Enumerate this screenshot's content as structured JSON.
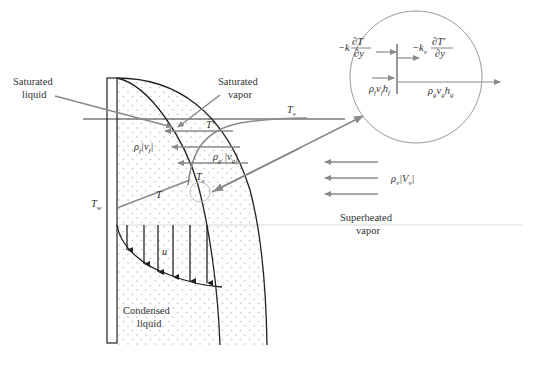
{
  "figure": {
    "colors": {
      "ink": "#222222",
      "gray_arrow": "#8a8a8a",
      "circle": "#9a9a9a",
      "dots": "#bdbdbd",
      "divider": "#c8c8c8"
    }
  },
  "labels": {
    "saturated_liquid_1": "Saturated",
    "saturated_liquid_2": "liquid",
    "saturated_vapor_1": "Saturated",
    "saturated_vapor_2": "vapor",
    "superheated_vapor_1": "Superheated",
    "superheated_vapor_2": "vapor",
    "condensed_liquid_1": "Condensed",
    "condensed_liquid_2": "liquid"
  },
  "symbols": {
    "T_v": "T",
    "T_v_sub": "v",
    "T_w": "T",
    "T_w_sub": "w",
    "T_s": "T",
    "T_s_sub": "s",
    "T_prime": "T′",
    "T_liquid": "T",
    "u": "u",
    "rho_f_vf": "ρ",
    "rho_f_vf_sub": "f",
    "rho_f_vf_rest": "|v",
    "rho_f_vf_rest_sub": "f",
    "rho_f_vf_end": "|",
    "rho_g_vg": "ρ",
    "rho_g_vg_sub": "g",
    "rho_g_vg_rest": " |v",
    "rho_g_vg_rest_sub": "g",
    "rho_g_vg_end": "|",
    "rho_v_Vv": "ρ",
    "rho_v_Vv_sub": "v",
    "rho_v_Vv_rest": "|V",
    "rho_v_Vv_rest_sub": "v",
    "rho_v_Vv_end": "|"
  },
  "inset": {
    "conduction_liquid_prefix": "−k",
    "conduction_liquid_num": "∂T",
    "conduction_liquid_den": "∂y",
    "conduction_vapor_prefix": "−k",
    "conduction_vapor_prefix_sub": "v",
    "conduction_vapor_num": "∂T′",
    "conduction_vapor_den": "∂y",
    "enthalpy_liquid": "ρ",
    "enthalpy_liquid_sub1": "f",
    "enthalpy_liquid_mid": "v",
    "enthalpy_liquid_sub2": "f",
    "enthalpy_liquid_h": "h",
    "enthalpy_liquid_sub3": "f",
    "enthalpy_vapor": "ρ",
    "enthalpy_vapor_sub1": "g",
    "enthalpy_vapor_mid": "v",
    "enthalpy_vapor_sub2": "g",
    "enthalpy_vapor_h": "h",
    "enthalpy_vapor_sub3": "g"
  }
}
